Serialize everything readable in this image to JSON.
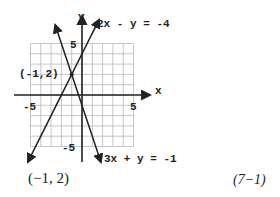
{
  "chart_data": {
    "type": "line",
    "title": "",
    "xlabel": "x",
    "ylabel": "y",
    "xlim": [
      -5,
      5
    ],
    "ylim": [
      -5,
      5
    ],
    "grid": true,
    "x_ticks": [
      "-5",
      "5"
    ],
    "y_ticks": [
      "5",
      "-5"
    ],
    "series": [
      {
        "name": "2x - y = -4",
        "equation": "2x - y = -4",
        "slope": 2,
        "intercept": 4
      },
      {
        "name": "3x + y = -1",
        "equation": "3x + y = -1",
        "slope": -3,
        "intercept": -1
      }
    ],
    "annotations": [
      {
        "text": "(-1, 2)",
        "x": -1,
        "y": 2,
        "type": "intersection-point"
      }
    ]
  },
  "labels": {
    "x_axis": "x",
    "y_axis": "y",
    "tick_x_neg": "-5",
    "tick_x_pos": "5",
    "tick_y_pos": "5",
    "tick_y_neg": "-5",
    "line1": "2x - y = -4",
    "line2": "3x + y = -1",
    "point": "(-1,2)"
  },
  "caption": {
    "answer": "(−1, 2)",
    "reference": "(7−1)"
  }
}
